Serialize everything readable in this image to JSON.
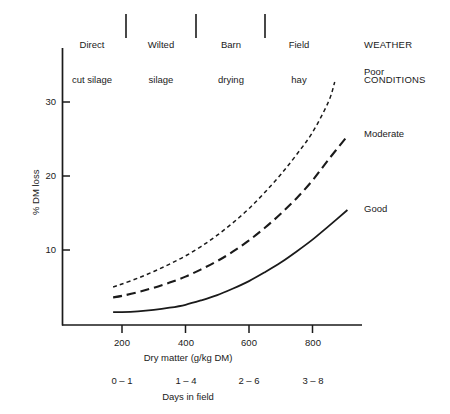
{
  "chart_data": {
    "type": "line",
    "title": "",
    "xlabel": "Dry matter (g/kg DM)",
    "ylabel": "% DM loss",
    "xlim": [
      0,
      950
    ],
    "ylim": [
      0,
      36
    ],
    "xticks": [
      200,
      400,
      600,
      800
    ],
    "yticks": [
      10,
      20,
      30
    ],
    "grid": false,
    "legend_position": "right-inline",
    "secondary_axis": {
      "label": "Days in field",
      "ticks": [
        "0 – 1",
        "1 – 4",
        "2 – 6",
        "3 – 8"
      ],
      "tick_x": [
        200,
        400,
        600,
        800
      ]
    },
    "stage_bands": [
      {
        "label": "Direct\ncut silage",
        "line1": "Direct",
        "line2": "cut silage"
      },
      {
        "label": "Wilted\nsilage",
        "line1": "Wilted",
        "line2": "silage"
      },
      {
        "label": "Barn\ndrying",
        "line1": "Barn",
        "line2": "drying"
      },
      {
        "label": "Field\nhay",
        "line1": "Field",
        "line2": "hay"
      }
    ],
    "legend_title_line1": "WEATHER",
    "legend_title_line2": "CONDITIONS",
    "series": [
      {
        "name": "Poor",
        "style": "dotted",
        "x": [
          172,
          200,
          250,
          300,
          350,
          400,
          450,
          500,
          550,
          600,
          650,
          700,
          750,
          800,
          850,
          870
        ],
        "values": [
          5.0,
          5.4,
          6.2,
          7.1,
          8.1,
          9.2,
          10.5,
          12.0,
          13.7,
          15.6,
          17.8,
          20.2,
          22.9,
          25.9,
          30.0,
          32.7
        ]
      },
      {
        "name": "Moderate",
        "style": "dashed",
        "x": [
          172,
          200,
          250,
          300,
          350,
          400,
          450,
          500,
          550,
          600,
          650,
          700,
          750,
          800,
          850,
          910
        ],
        "values": [
          3.6,
          3.8,
          4.3,
          4.9,
          5.6,
          6.4,
          7.4,
          8.5,
          9.8,
          11.3,
          13.0,
          14.9,
          17.0,
          19.4,
          22.2,
          25.4
        ]
      },
      {
        "name": "Good",
        "style": "solid",
        "x": [
          172,
          200,
          250,
          300,
          350,
          400,
          450,
          500,
          550,
          600,
          650,
          700,
          750,
          800,
          850,
          910
        ],
        "values": [
          1.6,
          1.6,
          1.7,
          1.9,
          2.2,
          2.6,
          3.2,
          3.9,
          4.8,
          5.8,
          7.0,
          8.3,
          9.8,
          11.4,
          13.2,
          15.4
        ]
      }
    ],
    "colors": {
      "axis": "#1a1a1a",
      "poor": "#1a1a1a",
      "moderate": "#1a1a1a",
      "good": "#1a1a1a",
      "background": "#ffffff"
    }
  },
  "labels": {
    "stage1_l1": "Direct",
    "stage1_l2": "cut silage",
    "stage2_l1": "Wilted",
    "stage2_l2": "silage",
    "stage3_l1": "Barn",
    "stage3_l2": "drying",
    "stage4_l1": "Field",
    "stage4_l2": "hay",
    "weather_l1": "WEATHER",
    "weather_l2": "CONDITIONS",
    "series_poor": "Poor",
    "series_moderate": "Moderate",
    "series_good": "Good",
    "ytick_30": "30",
    "ytick_20": "20",
    "ytick_10": "10",
    "xtick_200": "200",
    "xtick_400": "400",
    "xtick_600": "600",
    "xtick_800": "800",
    "xaxis_title": "Dry matter (g/kg DM)",
    "yaxis_title": "% DM loss",
    "days_200": "0 – 1",
    "days_400": "1 – 4",
    "days_600": "2 – 6",
    "days_800": "3 – 8",
    "days_title": "Days in field"
  }
}
